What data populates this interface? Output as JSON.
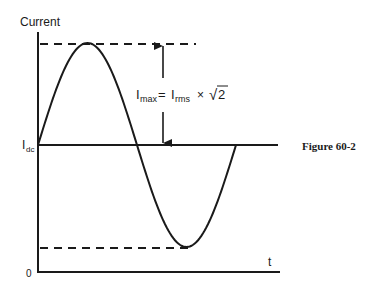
{
  "figure": {
    "caption": "Figure 60-2",
    "y_axis_label": "Current",
    "x_axis_label": "t",
    "origin_label": "0",
    "dc_level_label": {
      "main": "I",
      "sub": "dc"
    },
    "equation": {
      "lhs_main": "I",
      "lhs_sub": "max",
      "equals": "=",
      "rhs_main": "I",
      "rhs_sub": "rms",
      "times": "×",
      "sqrt_symbol": "√",
      "radicand": "2"
    },
    "waveform": {
      "type": "sine",
      "cycles": 1,
      "offset_label": "Idc",
      "amplitude_label": "Imax"
    }
  }
}
